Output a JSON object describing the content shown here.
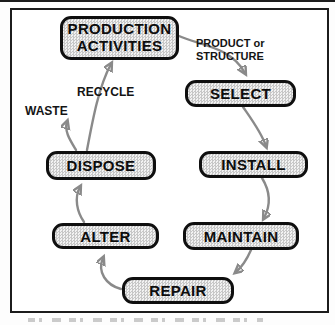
{
  "diagram": {
    "nodes": {
      "production": {
        "label": "PRODUCTION\nACTIVITIES"
      },
      "select": {
        "label": "SELECT"
      },
      "install": {
        "label": "INSTALL"
      },
      "maintain": {
        "label": "MAINTAIN"
      },
      "repair": {
        "label": "REPAIR"
      },
      "alter": {
        "label": "ALTER"
      },
      "dispose": {
        "label": "DISPOSE"
      }
    },
    "labels": {
      "product_or_structure": "PRODUCT or\nSTRUCTURE",
      "recycle": "RECYCLE",
      "waste": "WASTE"
    },
    "colors": {
      "arrow": "#8a8a8a",
      "node_border": "#0f0f0f",
      "node_fill_dot": "#c7c7c7",
      "frame_border": "#1c1c1c",
      "background": "#ffffff"
    }
  }
}
